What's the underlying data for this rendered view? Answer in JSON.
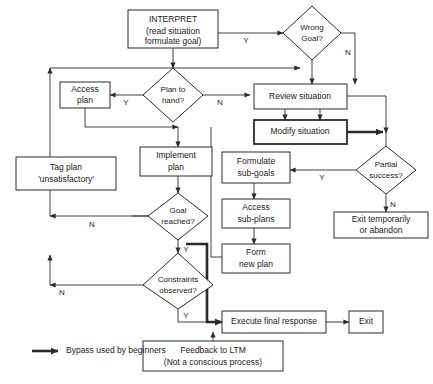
{
  "diagram": {
    "background_color": "#ffffff",
    "line_color": "#2a2a2a",
    "nodes": {
      "interpret": {
        "shape": "box",
        "line1": "INTERPRET",
        "line2": "(read situation",
        "line3": "formulate goal)"
      },
      "wrong_goal": {
        "shape": "diamond",
        "line1": "Wrong",
        "line2": "Goal?"
      },
      "plan_to_hand": {
        "shape": "diamond",
        "line1": "Plan to",
        "line2": "hand?"
      },
      "access_plan": {
        "shape": "box",
        "line1": "Access",
        "line2": "plan"
      },
      "review_situation": {
        "shape": "box",
        "line1": "Review situation"
      },
      "modify_situation": {
        "shape": "box",
        "line1": "Modify situation"
      },
      "partial_success": {
        "shape": "diamond",
        "line1": "Partial",
        "line2": "success?"
      },
      "exit_temporarily": {
        "shape": "box",
        "line1": "Exit temporarily",
        "line2": "or abandon"
      },
      "formulate_subgoals": {
        "shape": "box",
        "line1": "Formulate",
        "line2": "sub-goals"
      },
      "access_subplans": {
        "shape": "box",
        "line1": "Access",
        "line2": "sub-plans"
      },
      "form_new_plan": {
        "shape": "box",
        "line1": "Form",
        "line2": "new plan"
      },
      "implement_plan": {
        "shape": "box",
        "line1": "Implement",
        "line2": "plan"
      },
      "tag_plan": {
        "shape": "box",
        "line1": "Tag plan",
        "line2": "'unsatisfactory'"
      },
      "goal_reached": {
        "shape": "diamond",
        "line1": "Goal",
        "line2": "reached?"
      },
      "constraints_observed": {
        "shape": "diamond",
        "line1": "Constraints",
        "line2": "observed?"
      },
      "execute_final_response": {
        "shape": "box",
        "line1": "Execute final response"
      },
      "exit": {
        "shape": "box",
        "line1": "Exit"
      },
      "feedback_ltm": {
        "shape": "box",
        "line1": "Feedback to LTM",
        "line2": "(Not a conscious process)"
      }
    },
    "edge_labels": {
      "interpret_to_wrong_goal": "Y",
      "wrong_goal_no": "N",
      "plan_to_hand_yes": "Y",
      "plan_to_hand_no": "N",
      "partial_success_yes": "Y",
      "partial_success_no": "N",
      "goal_reached_no": "N",
      "goal_reached_yes": "Y",
      "constraints_no": "N",
      "constraints_yes": "Y"
    },
    "legend": {
      "marker": "thick-arrow",
      "label": "Bypass used by beginners"
    }
  }
}
